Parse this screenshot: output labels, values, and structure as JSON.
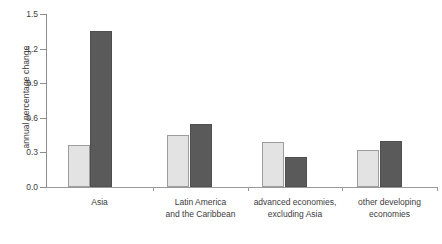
{
  "chart_data": {
    "type": "bar",
    "title": "",
    "subtitle": "",
    "xlabel": "",
    "ylabel": "annual percentage change",
    "ylim": [
      0.0,
      1.5
    ],
    "ytick_labels": [
      "0.0",
      "0.3",
      "0.6",
      "0.9",
      "1.2",
      "1.5"
    ],
    "yticks": [
      0.0,
      0.3,
      0.6,
      0.9,
      1.2,
      1.5
    ],
    "grid": false,
    "legend": "none",
    "categories": [
      "Asia",
      "Latin America and the Caribbean",
      "advanced economies, excluding Asia",
      "other developing economies"
    ],
    "category_label_lines": [
      [
        "Asia"
      ],
      [
        "Latin America",
        "and the Caribbean"
      ],
      [
        "advanced economies,",
        "excluding Asia"
      ],
      [
        "other developing",
        "economies"
      ]
    ],
    "series": [
      {
        "name": "series-1",
        "color": "#e3e3e3",
        "values": [
          0.36,
          0.45,
          0.39,
          0.26
        ]
      },
      {
        "name": "series-2",
        "color": "#5a5a5a",
        "values": [
          1.35,
          0.55,
          0.26,
          0.4
        ]
      }
    ],
    "bars": [
      {
        "group": 0,
        "series": 0,
        "value": 0.36,
        "shade": "light"
      },
      {
        "group": 0,
        "series": 1,
        "value": 1.35,
        "shade": "dark"
      },
      {
        "group": 1,
        "series": 0,
        "value": 0.45,
        "shade": "light"
      },
      {
        "group": 1,
        "series": 1,
        "value": 0.55,
        "shade": "dark"
      },
      {
        "group": 2,
        "series": 0,
        "value": 0.39,
        "shade": "light"
      },
      {
        "group": 2,
        "series": 1,
        "value": 0.26,
        "shade": "dark"
      },
      {
        "group": 3,
        "series": 0,
        "value": 0.32,
        "shade": "light"
      },
      {
        "group": 3,
        "series": 1,
        "value": 0.4,
        "shade": "dark"
      }
    ]
  },
  "axis": {
    "y_title": "annual percentage change"
  }
}
